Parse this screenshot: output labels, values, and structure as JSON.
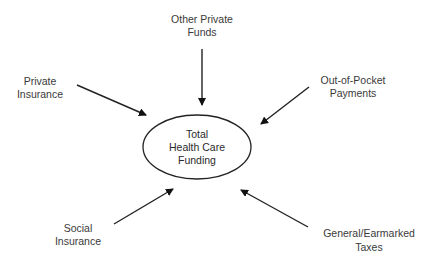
{
  "diagram": {
    "type": "hub-and-spoke",
    "colors": {
      "line": "#222222",
      "text": "#3a3a3a",
      "background": "#ffffff"
    },
    "center": {
      "lines": [
        "Total",
        "Health Care",
        "Funding"
      ],
      "shape": "ellipse",
      "cx": 197,
      "cy": 147,
      "rx": 54,
      "ry": 32
    },
    "sources": [
      {
        "id": "other-private-funds",
        "lines": [
          "Other Private",
          "Funds"
        ],
        "label_x": 202,
        "label_y": [
          19,
          32
        ],
        "arrow": {
          "x1": 202,
          "y1": 49,
          "x2": 202,
          "y2": 105
        }
      },
      {
        "id": "private-insurance",
        "lines": [
          "Private",
          "Insurance"
        ],
        "label_x": 40,
        "label_y": [
          81,
          94
        ],
        "arrow": {
          "x1": 77,
          "y1": 85,
          "x2": 146,
          "y2": 115
        }
      },
      {
        "id": "out-of-pocket-payments",
        "lines": [
          "Out-of-Pocket",
          "Payments"
        ],
        "label_x": 353,
        "label_y": [
          80,
          93
        ],
        "arrow": {
          "x1": 309,
          "y1": 87,
          "x2": 261,
          "y2": 124
        }
      },
      {
        "id": "social-insurance",
        "lines": [
          "Social",
          "Insurance"
        ],
        "label_x": 78,
        "label_y": [
          228,
          241
        ],
        "arrow": {
          "x1": 114,
          "y1": 224,
          "x2": 173,
          "y2": 189
        }
      },
      {
        "id": "general-earmarked-taxes",
        "lines": [
          "General/Earmarked",
          "Taxes"
        ],
        "label_x": 369,
        "label_y": [
          233,
          247
        ],
        "arrow": {
          "x1": 308,
          "y1": 227,
          "x2": 241,
          "y2": 190
        }
      }
    ]
  }
}
